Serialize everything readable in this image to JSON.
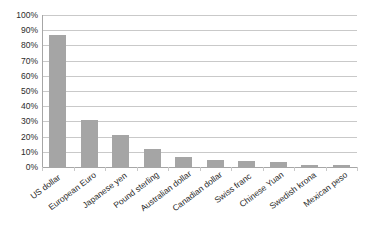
{
  "chart_data": {
    "type": "bar",
    "title": "",
    "subtitle": "",
    "xlabel": "",
    "ylabel": "",
    "ylim": [
      0,
      100
    ],
    "y_unit": "%",
    "grid": true,
    "legend": "none",
    "orientation": "vertical",
    "bar_color": "#a5a5a5",
    "gridline_color": "#c9c9c9",
    "axis_color": "#a6a6a6",
    "text_color": "#2b2b2b",
    "background": "#ffffff",
    "y_ticks": [
      "0%",
      "10%",
      "20%",
      "30%",
      "40%",
      "50%",
      "60%",
      "70%",
      "80%",
      "90%",
      "100%"
    ],
    "y_tick_values": [
      0,
      10,
      20,
      30,
      40,
      50,
      60,
      70,
      80,
      90,
      100
    ],
    "categories": [
      "US dollar",
      "European Euro",
      "Japanese yen",
      "Pound sterling",
      "Australian dollar",
      "Canadian dollar",
      "Swiss franc",
      "Chinese Yuan",
      "Swedish krona",
      "Mexican peso"
    ],
    "values": [
      87,
      31,
      21,
      12,
      6.5,
      4.5,
      3.8,
      3,
      1.2,
      1
    ]
  }
}
